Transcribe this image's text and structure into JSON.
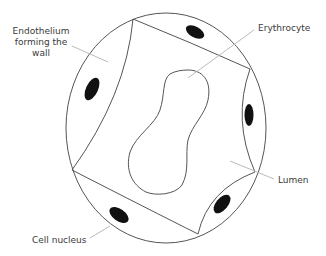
{
  "labels": {
    "endothelium": [
      "Endothelium",
      "forming the",
      "wall"
    ],
    "erythrocyte": "Erythrocyte",
    "lumen": "Lumen",
    "cell_nucleus": "Cell nucleus"
  },
  "colors": {
    "outline": "#555555",
    "leader": "#bbbbbb",
    "nucleus": "#111111",
    "text": "#3a3a3a",
    "background": "#ffffff"
  }
}
